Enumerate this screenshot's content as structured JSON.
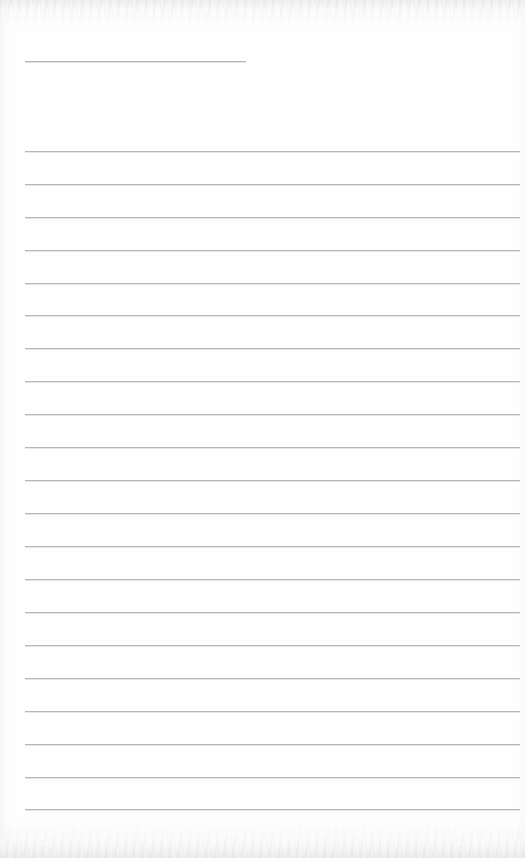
{
  "document": {
    "kind": "scanned-blank-ruled-page",
    "page_width": 525,
    "page_height": 858,
    "background_color": "#ffffff",
    "paper_tint": "#fefefe",
    "visible_text": "",
    "text_content_present": false,
    "notes_label": "",
    "title_label": ""
  },
  "ruling": {
    "line_color": "#b6b6bb",
    "line_highlight_color": "#e2e2e6",
    "line_thickness_px": 1,
    "left_margin_px": 25,
    "right_edge_px": 520,
    "line_length_px": 495,
    "first_body_line_y": 151,
    "line_spacing_px": 32.9,
    "body_line_count": 21,
    "body_line_y_positions": [
      151,
      184,
      217,
      250,
      283,
      315,
      348,
      381,
      414,
      447,
      480,
      513,
      546,
      579,
      612,
      645,
      678,
      711,
      744,
      777,
      809
    ]
  },
  "header_rule": {
    "name": "title-underline",
    "y": 61,
    "x_start": 25,
    "x_end": 246,
    "length_px": 221,
    "color": "#b3b3b9"
  },
  "scan_artifacts": {
    "top_band_height_px": 26,
    "bottom_band_height_px": 34,
    "noise_color": "#cdcdd2",
    "edge_shadow_color": "#e4e4e7"
  }
}
